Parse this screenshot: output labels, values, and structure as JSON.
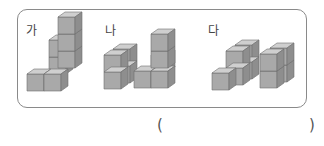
{
  "problem": {
    "figures": [
      {
        "label": "가",
        "cube_count": 7
      },
      {
        "label": "나",
        "cube_count": 9
      },
      {
        "label": "다",
        "cube_count": 9
      }
    ],
    "answer_blank": {
      "open": "(",
      "close": ")",
      "value": ""
    }
  },
  "colors": {
    "front": "#a9a9a9",
    "top": "#cfcfcf",
    "side": "#8e8e8e",
    "edge": "#6e6e6e",
    "border": "#8a8a8a"
  }
}
